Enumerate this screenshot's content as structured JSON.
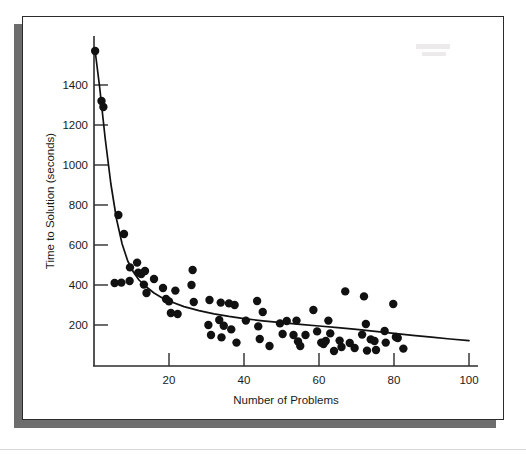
{
  "figure": {
    "background": "#ffffff",
    "panel_color": "#ffffff",
    "panel_border_color": "#2b2b2b",
    "shadow_color": "#6d6d6d",
    "ink_color": "#111111"
  },
  "chart_data": {
    "type": "scatter",
    "title": "",
    "xlabel": "Number of Problems",
    "ylabel": "Time to Solution (seconds)",
    "xlim": [
      0,
      105
    ],
    "ylim": [
      0,
      1620
    ],
    "xticks": [
      20,
      40,
      60,
      80,
      100
    ],
    "yticks": [
      200,
      400,
      600,
      800,
      1000,
      1200,
      1400
    ],
    "xtick_labels": [
      "20",
      "40",
      "60",
      "80",
      "100"
    ],
    "ytick_labels": [
      "200",
      "400",
      "600",
      "800",
      "1000",
      "1200",
      "1400"
    ],
    "grid": false,
    "legend": null,
    "point_marker": "filled-circle",
    "point_radius_px": 4.2,
    "series": [
      {
        "name": "observations",
        "type": "scatter",
        "color": "#111111",
        "points": [
          [
            0.3,
            1570
          ],
          [
            2.0,
            1320
          ],
          [
            2.5,
            1290
          ],
          [
            6.5,
            750
          ],
          [
            8.0,
            655
          ],
          [
            5.5,
            410
          ],
          [
            7.3,
            412
          ],
          [
            9.5,
            420
          ],
          [
            9.6,
            488
          ],
          [
            11.5,
            512
          ],
          [
            11.8,
            462
          ],
          [
            12.6,
            455
          ],
          [
            13.3,
            402
          ],
          [
            13.6,
            470
          ],
          [
            14.0,
            360
          ],
          [
            16.0,
            430
          ],
          [
            18.4,
            385
          ],
          [
            19.2,
            330
          ],
          [
            20.0,
            318
          ],
          [
            20.5,
            260
          ],
          [
            21.7,
            372
          ],
          [
            22.3,
            255
          ],
          [
            26.0,
            400
          ],
          [
            26.3,
            475
          ],
          [
            26.6,
            315
          ],
          [
            30.8,
            325
          ],
          [
            30.5,
            200
          ],
          [
            31.2,
            150
          ],
          [
            33.4,
            225
          ],
          [
            33.8,
            312
          ],
          [
            34.0,
            138
          ],
          [
            34.6,
            196
          ],
          [
            36.0,
            308
          ],
          [
            36.6,
            178
          ],
          [
            37.5,
            300
          ],
          [
            38.0,
            112
          ],
          [
            40.5,
            222
          ],
          [
            43.5,
            320
          ],
          [
            43.8,
            193
          ],
          [
            44.2,
            130
          ],
          [
            45.0,
            265
          ],
          [
            46.8,
            95
          ],
          [
            49.6,
            208
          ],
          [
            50.3,
            155
          ],
          [
            51.4,
            220
          ],
          [
            53.2,
            150
          ],
          [
            54.0,
            222
          ],
          [
            54.4,
            118
          ],
          [
            55.0,
            95
          ],
          [
            56.4,
            150
          ],
          [
            58.5,
            275
          ],
          [
            59.5,
            168
          ],
          [
            60.6,
            112
          ],
          [
            61.2,
            105
          ],
          [
            61.8,
            120
          ],
          [
            62.5,
            222
          ],
          [
            63.0,
            158
          ],
          [
            64.0,
            70
          ],
          [
            65.5,
            122
          ],
          [
            66.0,
            90
          ],
          [
            67.0,
            368
          ],
          [
            68.2,
            110
          ],
          [
            69.5,
            85
          ],
          [
            71.5,
            152
          ],
          [
            72.0,
            343
          ],
          [
            72.5,
            205
          ],
          [
            72.8,
            72
          ],
          [
            73.8,
            128
          ],
          [
            74.8,
            120
          ],
          [
            75.2,
            75
          ],
          [
            77.5,
            170
          ],
          [
            77.8,
            112
          ],
          [
            79.8,
            305
          ],
          [
            80.5,
            140
          ],
          [
            81.0,
            135
          ],
          [
            82.5,
            82
          ]
        ]
      },
      {
        "name": "fitted-power-curve",
        "type": "line",
        "color": "#111111",
        "description": "decaying power-law fit through the scatter",
        "points": [
          [
            0.3,
            1570
          ],
          [
            1.5,
            1390
          ],
          [
            3.0,
            1130
          ],
          [
            4.5,
            905
          ],
          [
            6.0,
            730
          ],
          [
            7.5,
            605
          ],
          [
            9.0,
            520
          ],
          [
            10.5,
            465
          ],
          [
            12.0,
            425
          ],
          [
            14.0,
            390
          ],
          [
            16.0,
            360
          ],
          [
            18.0,
            338
          ],
          [
            20.0,
            320
          ],
          [
            24.0,
            292
          ],
          [
            28.0,
            272
          ],
          [
            32.0,
            256
          ],
          [
            36.0,
            243
          ],
          [
            40.0,
            232
          ],
          [
            45.0,
            221
          ],
          [
            50.0,
            212
          ],
          [
            55.0,
            203
          ],
          [
            60.0,
            195
          ],
          [
            65.0,
            187
          ],
          [
            70.0,
            178
          ],
          [
            75.0,
            168
          ],
          [
            80.0,
            158
          ],
          [
            85.0,
            148
          ],
          [
            90.0,
            139
          ],
          [
            95.0,
            130
          ],
          [
            100.0,
            122
          ]
        ]
      }
    ]
  }
}
